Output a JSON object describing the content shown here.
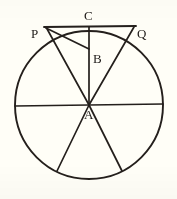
{
  "figure": {
    "background_color": "#fffef7",
    "stroke_color": "#241f1c",
    "canvas": {
      "width": 177,
      "height": 199
    },
    "circle": {
      "cx": 89,
      "cy": 105,
      "r": 74
    },
    "points": [
      {
        "id": "A",
        "label": "A",
        "x": 89,
        "y": 105,
        "label_x": 84,
        "label_y": 108,
        "role": "center"
      },
      {
        "id": "B",
        "label": "B",
        "x": 89,
        "y": 48,
        "label_x": 93,
        "label_y": 52,
        "role": "interior-point"
      },
      {
        "id": "C",
        "label": "C",
        "x": 89,
        "y": 31,
        "label_x": 84,
        "label_y": 9,
        "role": "circle-top"
      },
      {
        "id": "P",
        "label": "P",
        "x": 46,
        "y": 27,
        "label_x": 31,
        "label_y": 27,
        "role": "external-left"
      },
      {
        "id": "Q",
        "label": "Q",
        "x": 134,
        "y": 27,
        "label_x": 137,
        "label_y": 27,
        "role": "external-right"
      }
    ],
    "segments": [
      {
        "name": "tangent-PQ",
        "from": "P",
        "to": "Q"
      },
      {
        "name": "radius-A-to-C",
        "from": "A",
        "to": "C"
      },
      {
        "name": "line-A-to-P",
        "from": "A",
        "to": "P"
      },
      {
        "name": "line-A-to-Q",
        "from": "A",
        "to": "Q"
      },
      {
        "name": "chord-P-to-B",
        "from": "P",
        "to": "B"
      },
      {
        "name": "diameter-horizontal",
        "from": "left-rim",
        "to": "right-rim"
      },
      {
        "name": "spoke-A-lower-left",
        "from": "A",
        "to": "lower-left-rim"
      },
      {
        "name": "spoke-A-lower-right",
        "from": "A",
        "to": "lower-right-rim"
      }
    ],
    "rim_endpoints": {
      "left": {
        "x": 15,
        "y": 105
      },
      "right": {
        "x": 163,
        "y": 105
      },
      "lower_left": {
        "x": 57,
        "y": 171
      },
      "lower_right": {
        "x": 122,
        "y": 171
      }
    }
  }
}
